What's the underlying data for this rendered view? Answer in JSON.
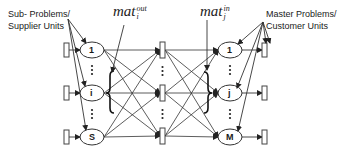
{
  "labels": {
    "left_line1": "Sub- Problems/",
    "left_line2": "Supplier Units",
    "right_line1": "Master Problems/",
    "right_line2": "Customer Units"
  },
  "math": {
    "out_base": "mat",
    "out_sup": "out",
    "out_sub": "i",
    "in_base": "mat",
    "in_sup": "in",
    "in_sub": "j"
  },
  "left_nodes": [
    "1",
    "i",
    "S"
  ],
  "right_nodes": [
    "1",
    "j",
    "M"
  ],
  "colors": {
    "stroke": "#333333",
    "background": "#ffffff"
  }
}
